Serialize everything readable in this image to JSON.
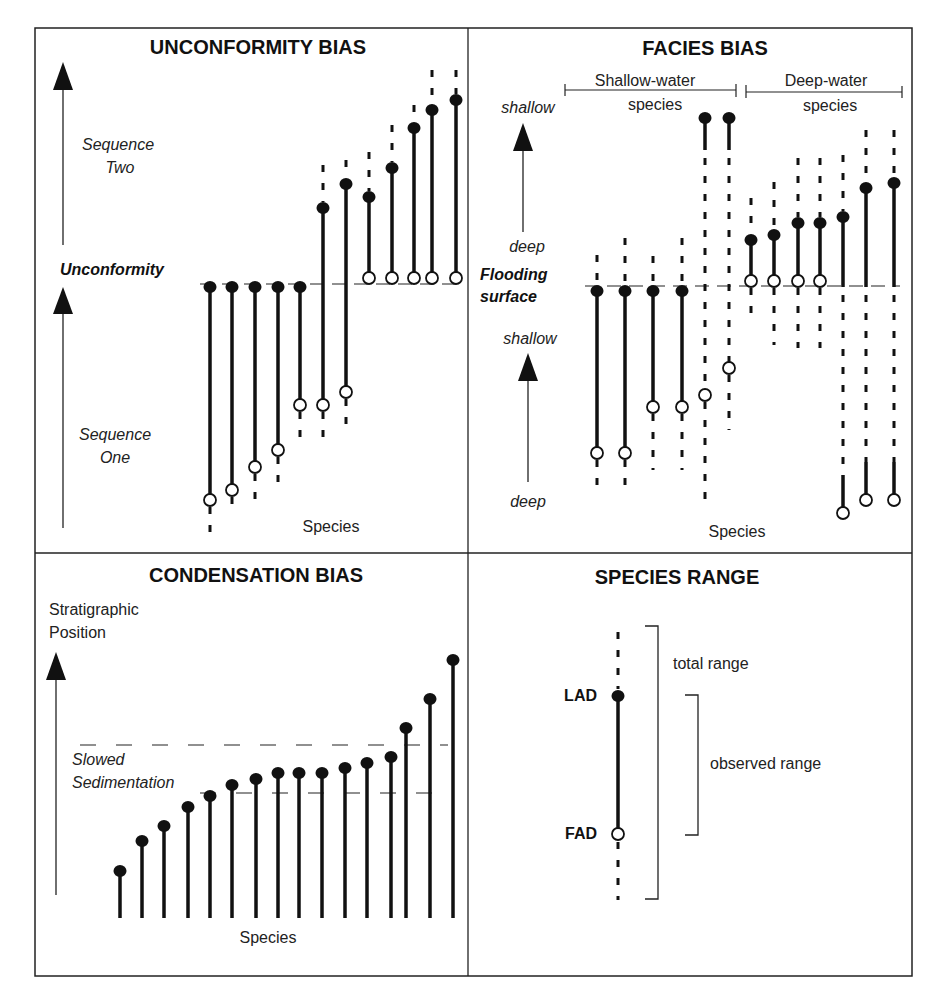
{
  "figure": {
    "panels": {
      "unconformity": {
        "title": "UNCONFORMITY BIAS",
        "axis_upper_label": [
          "Sequence",
          "Two"
        ],
        "axis_lower_label": [
          "Sequence",
          "One"
        ],
        "boundary_label": "Unconformity",
        "x_label": "Species",
        "boundary_y": 287,
        "species": [
          {
            "x": 210,
            "lad": 287,
            "fad": 500,
            "dash_top": null,
            "dash_bottom": 540
          },
          {
            "x": 232,
            "lad": 287,
            "fad": 490,
            "dash_top": null,
            "dash_bottom": 515
          },
          {
            "x": 255,
            "lad": 287,
            "fad": 467,
            "dash_top": null,
            "dash_bottom": 510
          },
          {
            "x": 278,
            "lad": 287,
            "fad": 450,
            "dash_top": null,
            "dash_bottom": 485
          },
          {
            "x": 300,
            "lad": 287,
            "fad": 405,
            "dash_top": null,
            "dash_bottom": 440
          },
          {
            "x": 323,
            "lad": 208,
            "fad": 405,
            "dash_top": 165,
            "dash_bottom": 445
          },
          {
            "x": 346,
            "lad": 184,
            "fad": 392,
            "dash_top": 160,
            "dash_bottom": 432
          },
          {
            "x": 369,
            "lad": 197,
            "fad": 278,
            "dash_top": 152,
            "dash_bottom": null
          },
          {
            "x": 392,
            "lad": 168,
            "fad": 278,
            "dash_top": 125,
            "dash_bottom": null
          },
          {
            "x": 414,
            "lad": 128,
            "fad": 278,
            "dash_top": 105,
            "dash_bottom": null
          },
          {
            "x": 432,
            "lad": 110,
            "fad": 278,
            "dash_top": 70,
            "dash_bottom": null
          },
          {
            "x": 456,
            "lad": 100,
            "fad": 278,
            "dash_top": 70,
            "dash_bottom": null
          }
        ]
      },
      "facies": {
        "title": "FACIES BIAS",
        "group_left": [
          "Shallow-water",
          "species"
        ],
        "group_right": [
          "Deep-water",
          "species"
        ],
        "axis_upper": {
          "top": "shallow",
          "bottom": "deep"
        },
        "axis_lower": {
          "top": "shallow",
          "bottom": "deep"
        },
        "boundary_label": [
          "Flooding",
          "surface"
        ],
        "x_label": "Species",
        "boundary_y": 287,
        "species": [
          {
            "x": 597,
            "lad": 291,
            "fad": 453,
            "dash_top": 255,
            "dash_bottom": 495
          },
          {
            "x": 625,
            "lad": 291,
            "fad": 453,
            "dash_top": 238,
            "dash_bottom": 492
          },
          {
            "x": 653,
            "lad": 291,
            "fad": 407,
            "dash_top": 256,
            "dash_bottom": 470
          },
          {
            "x": 682,
            "lad": 291,
            "fad": 407,
            "dash_top": 238,
            "dash_bottom": 470
          },
          {
            "x": 705,
            "lad": 118,
            "fad": 395,
            "dash_top": null,
            "dash_bottom": 510,
            "solid_to": 150
          },
          {
            "x": 729,
            "lad": 118,
            "fad": 368,
            "dash_top": null,
            "dash_bottom": 430,
            "solid_to": 150
          },
          {
            "x": 751,
            "lad": 240,
            "fad": 281,
            "dash_top": 198,
            "dash_bottom": 320
          },
          {
            "x": 774,
            "lad": 235,
            "fad": 281,
            "dash_top": 182,
            "dash_bottom": 345
          },
          {
            "x": 798,
            "lad": 223,
            "fad": 281,
            "dash_top": 158,
            "dash_bottom": 348
          },
          {
            "x": 820,
            "lad": 223,
            "fad": 281,
            "dash_top": 158,
            "dash_bottom": 348
          },
          {
            "x": 843,
            "lad": 217,
            "fad": 513,
            "dash_top": 155,
            "dash_bottom": null,
            "gap_from": 287,
            "gap_to": 475
          },
          {
            "x": 866,
            "lad": 188,
            "fad": 500,
            "dash_top": 130,
            "dash_bottom": null,
            "gap_from": 287,
            "gap_to": 462
          },
          {
            "x": 894,
            "lad": 183,
            "fad": 500,
            "dash_top": 130,
            "dash_bottom": null,
            "gap_from": 287,
            "gap_to": 462
          }
        ]
      },
      "condensation": {
        "title": "CONDENSATION BIAS",
        "axis_label": [
          "Stratigraphic",
          "Position"
        ],
        "zone_label": [
          "Slowed",
          "Sedimentation"
        ],
        "x_label": "Species",
        "zone_top_y": 745,
        "zone_bottom_y": 793,
        "baseline_y": 918,
        "species": [
          {
            "x": 120,
            "lad": 871
          },
          {
            "x": 142,
            "lad": 841
          },
          {
            "x": 164,
            "lad": 826
          },
          {
            "x": 188,
            "lad": 807
          },
          {
            "x": 210,
            "lad": 796
          },
          {
            "x": 232,
            "lad": 785
          },
          {
            "x": 256,
            "lad": 779
          },
          {
            "x": 278,
            "lad": 773
          },
          {
            "x": 299,
            "lad": 773
          },
          {
            "x": 322,
            "lad": 773
          },
          {
            "x": 345,
            "lad": 768
          },
          {
            "x": 367,
            "lad": 763
          },
          {
            "x": 391,
            "lad": 757
          },
          {
            "x": 406,
            "lad": 728
          },
          {
            "x": 430,
            "lad": 699
          },
          {
            "x": 453,
            "lad": 660
          }
        ]
      },
      "species_range": {
        "title": "SPECIES RANGE",
        "lad_label": "LAD",
        "fad_label": "FAD",
        "total_range_label": "total range",
        "observed_range_label": "observed range",
        "x": 618,
        "lad_y": 696,
        "fad_y": 834,
        "dash_top": 632,
        "dash_bottom": 900,
        "total_bracket": {
          "x": 658,
          "top": 626,
          "bottom": 899
        },
        "observed_bracket": {
          "x": 698,
          "top": 695,
          "bottom": 835
        }
      }
    },
    "caption_partial": "Biases ... in this ... ... ... ..."
  },
  "chart_data": {
    "type": "diagram",
    "panels": [
      {
        "name": "UNCONFORMITY BIAS",
        "y_axis": "Sequence One / Sequence Two",
        "x_axis": "Species",
        "species_count": 12,
        "boundary": "Unconformity"
      },
      {
        "name": "FACIES BIAS",
        "y_axis": "deep to shallow (two cycles)",
        "x_axis": "Species",
        "groups": [
          "Shallow-water species",
          "Deep-water species"
        ],
        "species_count": 13,
        "boundary": "Flooding surface"
      },
      {
        "name": "CONDENSATION BIAS",
        "y_axis": "Stratigraphic Position",
        "x_axis": "Species",
        "species_count": 16,
        "zone": "Slowed Sedimentation"
      },
      {
        "name": "SPECIES RANGE",
        "markers": {
          "LAD": "filled circle",
          "FAD": "open circle"
        },
        "ranges": [
          "total range",
          "observed range"
        ]
      }
    ]
  }
}
